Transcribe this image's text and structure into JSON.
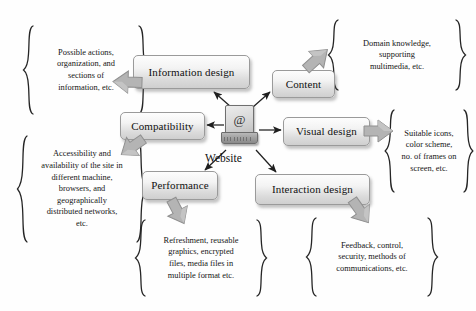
{
  "diagram": {
    "hub": {
      "label": "Website",
      "icon_glyph": "@",
      "icon_name": "laptop-icon"
    },
    "accent_colors": {
      "box_border": "#9a9a9a",
      "box_fill_light": "#fdfdfd",
      "box_fill_dark": "#cfcfcf",
      "arrow": "#2b2b2b",
      "block_arrow": "#a8a8a8",
      "background": "#ffffff"
    },
    "nodes": [
      {
        "id": "information-design",
        "label": "Information design"
      },
      {
        "id": "content",
        "label": "Content"
      },
      {
        "id": "compatibility",
        "label": "Compatibility"
      },
      {
        "id": "visual-design",
        "label": "Visual design"
      },
      {
        "id": "performance",
        "label": "Performance"
      },
      {
        "id": "interaction-design",
        "label": "Interaction design"
      }
    ],
    "annotations": [
      {
        "id": "information-design-note",
        "for": "information-design",
        "text": "Possible actions,\norganization, and\nsections of\ninformation, etc."
      },
      {
        "id": "content-note",
        "for": "content",
        "text": "Domain knowledge,\nsupporting\nmultimedia, etc."
      },
      {
        "id": "compatibility-note",
        "for": "compatibility",
        "text": "Accessibility and\navailability of the site in\ndifferent machine,\nbrowsers, and\ngeographically\ndistributed networks,\netc."
      },
      {
        "id": "visual-design-note",
        "for": "visual-design",
        "text": "Suitable icons,\ncolor scheme,\nno. of frames on\nscreen, etc."
      },
      {
        "id": "performance-note",
        "for": "performance",
        "text": "Refreshment, reusable\ngraphics, encrypted\nfiles, media files in\nmultiple format etc."
      },
      {
        "id": "interaction-design-note",
        "for": "interaction-design",
        "text": "Feedback, control,\nsecurity, methods of\ncommunications, etc."
      }
    ],
    "connections": [
      {
        "from": "website",
        "to": "information-design"
      },
      {
        "from": "website",
        "to": "content"
      },
      {
        "from": "website",
        "to": "compatibility"
      },
      {
        "from": "website",
        "to": "visual-design"
      },
      {
        "from": "website",
        "to": "performance"
      },
      {
        "from": "website",
        "to": "interaction-design"
      }
    ]
  }
}
